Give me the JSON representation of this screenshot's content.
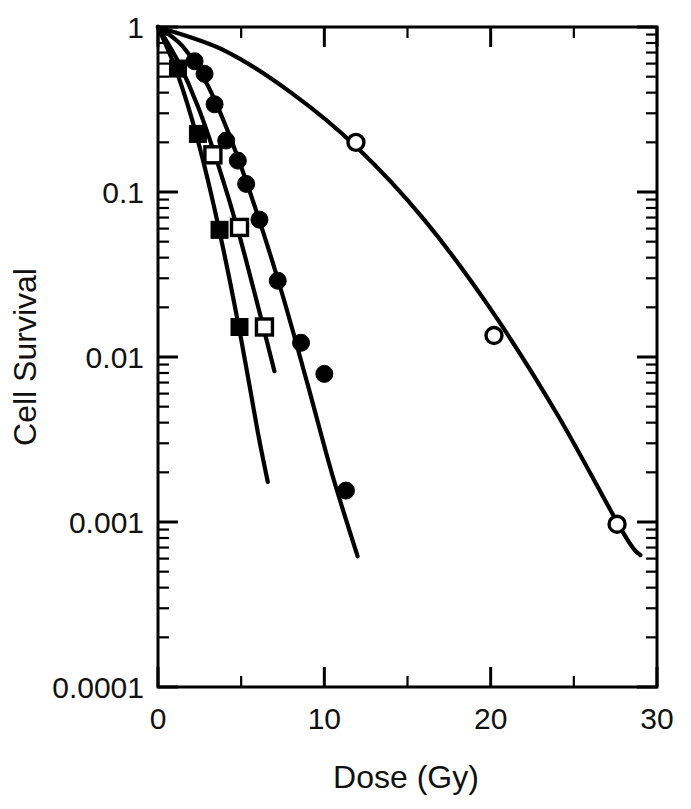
{
  "chart_data": {
    "type": "line",
    "title": "",
    "subtitle": "",
    "xlabel": "Dose (Gy)",
    "ylabel": "Cell Survival",
    "xlim": [
      0,
      30
    ],
    "ylim": [
      0.0001,
      1
    ],
    "yscale": "log",
    "xscale": "linear",
    "grid": false,
    "legend": "none",
    "xticks": [
      0,
      10,
      20,
      30
    ],
    "xticklabels": [
      "0",
      "10",
      "20",
      "30"
    ],
    "xminorticks": [
      5,
      15,
      25
    ],
    "yticks": [
      1,
      0.1,
      0.01,
      0.001,
      0.0001
    ],
    "yticklabels": [
      "1",
      "0.1",
      "0.01",
      "0.001",
      "0.0001"
    ],
    "series": [
      {
        "name": "open-circle-series",
        "marker": "open-circle",
        "points": [
          {
            "x": 0.0,
            "y": 1.0
          },
          {
            "x": 11.9,
            "y": 0.2
          },
          {
            "x": 20.2,
            "y": 0.0135
          },
          {
            "x": 27.6,
            "y": 0.00097
          }
        ],
        "fit_curve": [
          {
            "x": 0.0,
            "y": 1.0
          },
          {
            "x": 4.0,
            "y": 0.72
          },
          {
            "x": 8.0,
            "y": 0.4
          },
          {
            "x": 12.0,
            "y": 0.185
          },
          {
            "x": 16.0,
            "y": 0.068
          },
          {
            "x": 20.0,
            "y": 0.0195
          },
          {
            "x": 24.0,
            "y": 0.0045
          },
          {
            "x": 28.0,
            "y": 0.00085
          },
          {
            "x": 29.0,
            "y": 0.00063
          }
        ]
      },
      {
        "name": "filled-circle-series",
        "marker": "filled-circle",
        "points": [
          {
            "x": 0.0,
            "y": 1.0
          },
          {
            "x": 2.2,
            "y": 0.62
          },
          {
            "x": 2.8,
            "y": 0.52
          },
          {
            "x": 3.4,
            "y": 0.34
          },
          {
            "x": 4.1,
            "y": 0.205
          },
          {
            "x": 4.8,
            "y": 0.155
          },
          {
            "x": 5.3,
            "y": 0.112
          },
          {
            "x": 6.1,
            "y": 0.068
          },
          {
            "x": 7.2,
            "y": 0.029
          },
          {
            "x": 8.6,
            "y": 0.0122
          },
          {
            "x": 10.0,
            "y": 0.0079
          },
          {
            "x": 11.3,
            "y": 0.00155
          }
        ],
        "fit_curve": [
          {
            "x": 0.0,
            "y": 1.0
          },
          {
            "x": 1.5,
            "y": 0.76
          },
          {
            "x": 3.0,
            "y": 0.44
          },
          {
            "x": 4.5,
            "y": 0.195
          },
          {
            "x": 6.0,
            "y": 0.072
          },
          {
            "x": 7.5,
            "y": 0.0235
          },
          {
            "x": 9.0,
            "y": 0.0068
          },
          {
            "x": 10.5,
            "y": 0.0019
          },
          {
            "x": 12.0,
            "y": 0.00062
          }
        ]
      },
      {
        "name": "open-square-series",
        "marker": "open-square",
        "points": [
          {
            "x": 0.0,
            "y": 1.0
          },
          {
            "x": 3.3,
            "y": 0.168
          },
          {
            "x": 4.9,
            "y": 0.061
          },
          {
            "x": 6.4,
            "y": 0.0152
          }
        ],
        "fit_curve": [
          {
            "x": 0.0,
            "y": 1.0
          },
          {
            "x": 1.2,
            "y": 0.62
          },
          {
            "x": 2.4,
            "y": 0.33
          },
          {
            "x": 3.6,
            "y": 0.148
          },
          {
            "x": 4.8,
            "y": 0.059
          },
          {
            "x": 6.0,
            "y": 0.0205
          },
          {
            "x": 7.0,
            "y": 0.0082
          }
        ]
      },
      {
        "name": "filled-square-series",
        "marker": "filled-square",
        "points": [
          {
            "x": 0.0,
            "y": 1.0
          },
          {
            "x": 1.2,
            "y": 0.56
          },
          {
            "x": 2.4,
            "y": 0.225
          },
          {
            "x": 3.7,
            "y": 0.059
          },
          {
            "x": 4.9,
            "y": 0.0152
          }
        ],
        "fit_curve": [
          {
            "x": 0.0,
            "y": 1.0
          },
          {
            "x": 1.0,
            "y": 0.58
          },
          {
            "x": 2.0,
            "y": 0.285
          },
          {
            "x": 3.0,
            "y": 0.118
          },
          {
            "x": 4.0,
            "y": 0.0415
          },
          {
            "x": 5.0,
            "y": 0.0128
          },
          {
            "x": 6.0,
            "y": 0.0035
          },
          {
            "x": 6.6,
            "y": 0.00175
          }
        ]
      }
    ]
  },
  "axis": {
    "x_title": "Dose (Gy)",
    "y_title": "Cell Survival",
    "x_tick_0": "0",
    "x_tick_1": "10",
    "x_tick_2": "20",
    "x_tick_3": "30",
    "y_tick_0": "1",
    "y_tick_1": "0.1",
    "y_tick_2": "0.01",
    "y_tick_3": "0.001",
    "y_tick_4": "0.0001"
  },
  "colors": {
    "ink": "#000000",
    "background": "#ffffff"
  }
}
